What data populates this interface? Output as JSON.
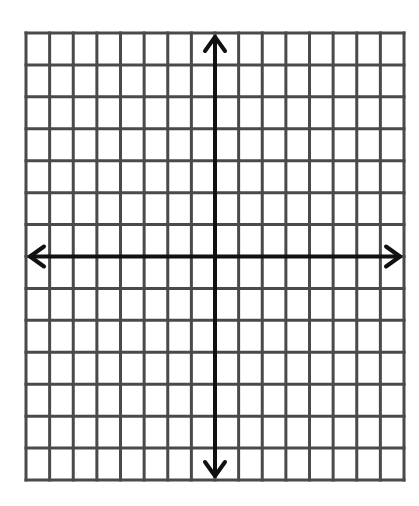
{
  "diagram": {
    "type": "coordinate-plane",
    "title": "",
    "grid": {
      "columns": 16,
      "rows": 14,
      "left": 26,
      "top": 33,
      "right": 404,
      "bottom": 480,
      "line_color": "#4a4a4a",
      "line_width": 3
    },
    "axes": {
      "x_axis_row_index": 7,
      "y_axis_col_index": 8,
      "color": "#111111",
      "line_width": 4,
      "arrows": [
        "left",
        "right",
        "up",
        "down"
      ],
      "labels": []
    },
    "background": "#ffffff"
  }
}
